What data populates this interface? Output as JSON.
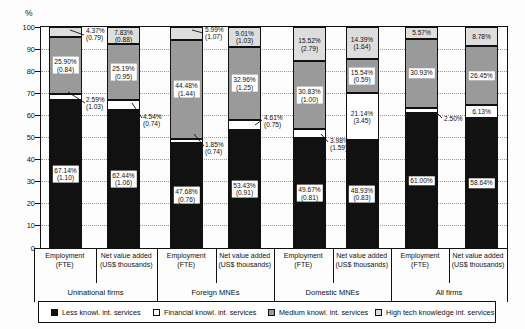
{
  "chart_data": {
    "type": "bar",
    "stacked": true,
    "ylabel": "%",
    "ylim": [
      0,
      100
    ],
    "yticks": [
      0,
      10,
      20,
      30,
      40,
      50,
      60,
      70,
      80,
      90,
      100
    ],
    "grid": "dotted horizontal",
    "legend_position": "bottom",
    "note_meaning": "values in parentheses shown on chart",
    "series": [
      {
        "key": "less",
        "name": "Less knowl. int. services",
        "color": "#111111"
      },
      {
        "key": "financial",
        "name": "Financial knowl. int. services",
        "color": "#ffffff"
      },
      {
        "key": "medium",
        "name": "Medium knowl. int. services",
        "color": "#9a9a9a"
      },
      {
        "key": "hightech",
        "name": "High tech knowledge int. services",
        "color": "#dddddd"
      }
    ],
    "groups": [
      {
        "label": "Uninational firms",
        "bars": [
          {
            "x_label": [
              "Employment",
              "(FTE)"
            ],
            "values": {
              "less": "67.14",
              "financial": "2.59",
              "medium": "25.90",
              "hightech": "4.37"
            },
            "notes": {
              "less": "1.10",
              "financial": "1.03",
              "medium": "0.84",
              "hightech": "0.79"
            }
          },
          {
            "x_label": [
              "Net value added",
              "(US$ thousands)"
            ],
            "values": {
              "less": "62.44",
              "financial": "4.54",
              "medium": "25.19",
              "hightech": "7.83"
            },
            "notes": {
              "less": "1.06",
              "financial": "0.74",
              "medium": "0.95",
              "hightech": "0.88"
            }
          }
        ]
      },
      {
        "label": "Foreign MNEs",
        "bars": [
          {
            "x_label": [
              "Employment",
              "(FTE)"
            ],
            "values": {
              "less": "47.68",
              "financial": "1.85",
              "medium": "44.48",
              "hightech": "5.99"
            },
            "notes": {
              "less": "0.76",
              "financial": "0.74",
              "medium": "1.44",
              "hightech": "1.07"
            }
          },
          {
            "x_label": [
              "Net value added",
              "(US$ thousands)"
            ],
            "values": {
              "less": "53.43",
              "financial": "4.61",
              "medium": "32.96",
              "hightech": "9.01"
            },
            "notes": {
              "less": "0.91",
              "financial": "0.75",
              "medium": "1.25",
              "hightech": "1.03"
            }
          }
        ]
      },
      {
        "label": "Domestic MNEs",
        "bars": [
          {
            "x_label": [
              "Employment",
              "(FTE)"
            ],
            "values": {
              "less": "49.67",
              "financial": "3.98",
              "medium": "30.83",
              "hightech": "15.52"
            },
            "notes": {
              "less": "0.81",
              "financial": "1.59",
              "medium": "1.00",
              "hightech": "2.79"
            }
          },
          {
            "x_label": [
              "Net value added",
              "(US$ thousands)"
            ],
            "values": {
              "less": "48.93",
              "financial": "21.14",
              "medium": "15.54",
              "hightech": "14.39"
            },
            "notes": {
              "less": "0.83",
              "financial": "3.45",
              "medium": "0.59",
              "hightech": "1.64"
            }
          }
        ]
      },
      {
        "label": "All firms",
        "bars": [
          {
            "x_label": [
              "Employment",
              "(FTE)"
            ],
            "values": {
              "less": "61.00",
              "financial": "2.50",
              "medium": "30.93",
              "hightech": "5.57"
            },
            "notes": {}
          },
          {
            "x_label": [
              "Net value added",
              "(US$ thousands)"
            ],
            "values": {
              "less": "58.64",
              "financial": "6.13",
              "medium": "26.45",
              "hightech": "8.78"
            },
            "notes": {}
          }
        ]
      }
    ]
  }
}
